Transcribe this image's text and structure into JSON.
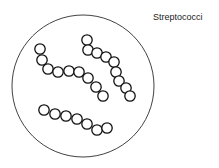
{
  "title": "Streptococci",
  "colors": {
    "stroke": "#111111",
    "background": "#ffffff"
  },
  "field": {
    "cx": 83,
    "cy": 86,
    "r": 71
  },
  "coccus_radius": 5.2,
  "chains": [
    {
      "name": "chain-upper-left",
      "cocci": [
        [
          40,
          49
        ],
        [
          42,
          60
        ],
        [
          48,
          69
        ],
        [
          58,
          72
        ],
        [
          69,
          71
        ],
        [
          79,
          72
        ],
        [
          88,
          78
        ],
        [
          96,
          87
        ],
        [
          103,
          96
        ]
      ]
    },
    {
      "name": "chain-upper-right",
      "cocci": [
        [
          87,
          40
        ],
        [
          88,
          50
        ],
        [
          97,
          53
        ],
        [
          106,
          57
        ],
        [
          114,
          62
        ],
        [
          116,
          72
        ],
        [
          119,
          81
        ],
        [
          126,
          88
        ],
        [
          130,
          96
        ]
      ]
    },
    {
      "name": "chain-lower",
      "cocci": [
        [
          44,
          110
        ],
        [
          55,
          114
        ],
        [
          66,
          116
        ],
        [
          77,
          119
        ],
        [
          87,
          124
        ],
        [
          97,
          130
        ],
        [
          107,
          128
        ]
      ]
    }
  ]
}
